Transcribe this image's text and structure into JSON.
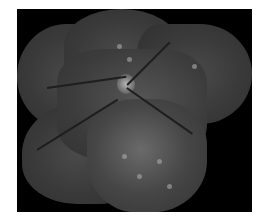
{
  "image": {
    "subject": "retinal fundus montage",
    "background_color": "#000000",
    "page_color": "#ffffff"
  }
}
